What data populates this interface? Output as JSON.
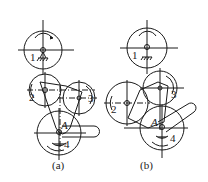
{
  "diagram": {
    "type": "gear mechanism schematic",
    "panels": [
      {
        "caption": "(a)",
        "labels": {
          "gear1": "1",
          "gear2": "2",
          "gear3": "3",
          "gear4": "4",
          "pivot": "A"
        }
      },
      {
        "caption": "(b)",
        "labels": {
          "gear1": "1",
          "gear2": "2",
          "gear3": "3",
          "gear4": "4",
          "pivot": "A"
        }
      }
    ],
    "line_color": "#1a1a1a"
  }
}
